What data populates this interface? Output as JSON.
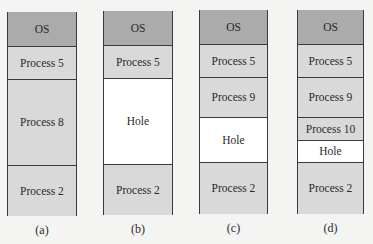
{
  "diagram": {
    "panels": [
      {
        "caption": "(a)",
        "x": 7,
        "top": 12,
        "width": 70,
        "bottom": 216,
        "blocks": [
          {
            "label": "OS",
            "type": "os",
            "y0": 12,
            "y1": 47
          },
          {
            "label": "Process 5",
            "type": "proc",
            "y0": 47,
            "y1": 80
          },
          {
            "label": "Process 8",
            "type": "proc",
            "y0": 80,
            "y1": 166
          },
          {
            "label": "Process 2",
            "type": "proc",
            "y0": 166,
            "y1": 216
          }
        ]
      },
      {
        "caption": "(b)",
        "x": 103,
        "top": 11,
        "width": 70,
        "bottom": 215,
        "blocks": [
          {
            "label": "OS",
            "type": "os",
            "y0": 11,
            "y1": 46
          },
          {
            "label": "Process 5",
            "type": "proc",
            "y0": 46,
            "y1": 79
          },
          {
            "label": "Hole",
            "type": "hole",
            "y0": 79,
            "y1": 165
          },
          {
            "label": "Process 2",
            "type": "proc",
            "y0": 165,
            "y1": 215
          }
        ]
      },
      {
        "caption": "(c)",
        "x": 199,
        "top": 10,
        "width": 69,
        "bottom": 214,
        "blocks": [
          {
            "label": "OS",
            "type": "os",
            "y0": 10,
            "y1": 45
          },
          {
            "label": "Process 5",
            "type": "proc",
            "y0": 45,
            "y1": 78
          },
          {
            "label": "Process 9",
            "type": "proc",
            "y0": 78,
            "y1": 118
          },
          {
            "label": "Hole",
            "type": "hole",
            "y0": 118,
            "y1": 163
          },
          {
            "label": "Process 2",
            "type": "proc",
            "y0": 163,
            "y1": 214
          }
        ]
      },
      {
        "caption": "(d)",
        "x": 297,
        "top": 10,
        "width": 67,
        "bottom": 214,
        "blocks": [
          {
            "label": "OS",
            "type": "os",
            "y0": 10,
            "y1": 45
          },
          {
            "label": "Process 5",
            "type": "proc",
            "y0": 45,
            "y1": 78
          },
          {
            "label": "Process 9",
            "type": "proc",
            "y0": 78,
            "y1": 118
          },
          {
            "label": "Process 10",
            "type": "proc",
            "y0": 118,
            "y1": 141
          },
          {
            "label": "Hole",
            "type": "hole",
            "y0": 141,
            "y1": 163
          },
          {
            "label": "Process 2",
            "type": "proc",
            "y0": 163,
            "y1": 214
          }
        ]
      }
    ],
    "colors": {
      "os": "#ababab",
      "process": "#d9d9d9",
      "hole": "#ffffff",
      "border": "#3a3a3a",
      "background": "#f4f4f2"
    }
  }
}
